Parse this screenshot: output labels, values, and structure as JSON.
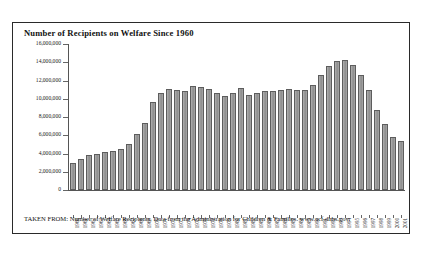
{
  "chart_data": {
    "type": "bar",
    "title": "Number of Recipients on Welfare Since 1960",
    "xlabel": "",
    "ylabel": "",
    "ylim": [
      0,
      16000000
    ],
    "ytick_labels": [
      "16,000,000",
      "14,000,000",
      "12,000,000",
      "10,000,000",
      "8,000,000",
      "6,000,000",
      "4,000,000",
      "2,000,000",
      "0"
    ],
    "ytick_values": [
      16000000,
      14000000,
      12000000,
      10000000,
      8000000,
      6000000,
      4000000,
      2000000,
      0
    ],
    "grid": false,
    "legend": "none",
    "categories": [
      "1960",
      "1961",
      "1962",
      "1963",
      "1964",
      "1965",
      "1966",
      "1967",
      "1968",
      "1969",
      "1970",
      "1971",
      "1972",
      "1973",
      "1974",
      "1975",
      "1976",
      "1977",
      "1978",
      "1979",
      "1980",
      "1981",
      "1982",
      "1983",
      "1984",
      "1985",
      "1986",
      "1987",
      "1988",
      "1989",
      "1990",
      "1991",
      "1992",
      "1993",
      "1994",
      "1995",
      "1996",
      "1997",
      "1998",
      "1999",
      "2000",
      "2001"
    ],
    "values": [
      3005000,
      3354000,
      3789000,
      3930000,
      4118000,
      4329000,
      4513000,
      5014000,
      6086000,
      7313000,
      9659000,
      10651000,
      11069000,
      10949000,
      10864000,
      11346000,
      11304000,
      11050000,
      10672000,
      10318000,
      10597000,
      11160000,
      10431000,
      10659000,
      10866000,
      10813000,
      10993000,
      11065000,
      10920000,
      10935000,
      11460000,
      12595000,
      13625000,
      14143000,
      14226000,
      13652000,
      12649000,
      10936000,
      8770000,
      7188000,
      5781000,
      5359000
    ],
    "value_unit": "recipients"
  },
  "footer": {
    "text": "TAKEN FROM: Number of Welfare Recipients. Data from the Administration for Children & Families. www.acf.dhhs.gov."
  }
}
